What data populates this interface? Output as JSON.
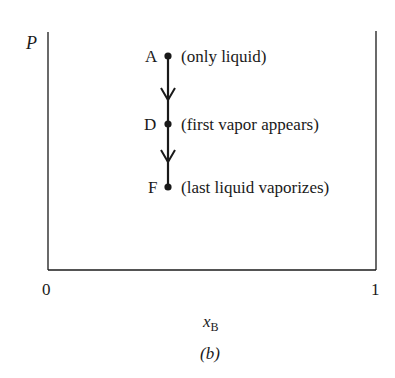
{
  "figure": {
    "y_axis_label": "P",
    "x_axis_label_main": "x",
    "x_axis_label_sub": "B",
    "x_ticks": [
      "0",
      "1"
    ],
    "caption": "(b)",
    "points": [
      {
        "id": "A",
        "label": "A",
        "note": "(only liquid)"
      },
      {
        "id": "D",
        "label": "D",
        "note": "(first vapor appears)"
      },
      {
        "id": "F",
        "label": "F",
        "note": "(last liquid vaporizes)"
      }
    ],
    "colors": {
      "ink": "#1a1a1a",
      "background": "#ffffff"
    }
  }
}
